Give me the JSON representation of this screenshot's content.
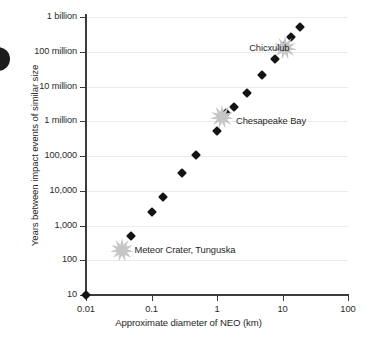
{
  "chart_data": {
    "type": "scatter",
    "title": "",
    "xlabel": "Approximate diameter of NEO (km)",
    "ylabel": "Years between impact events of similar size",
    "xscale": "log",
    "yscale": "log",
    "xlim": [
      0.01,
      100
    ],
    "ylim": [
      10,
      1000000000
    ],
    "grid": true,
    "legend": "none",
    "xticks": [
      {
        "value": 0.01,
        "label": "0.01"
      },
      {
        "value": 0.1,
        "label": "0.1"
      },
      {
        "value": 1,
        "label": "1"
      },
      {
        "value": 10,
        "label": "10"
      },
      {
        "value": 100,
        "label": "100"
      }
    ],
    "yticks": [
      {
        "value": 1000000000,
        "label": "1 billion"
      },
      {
        "value": 100000000,
        "label": "100 million"
      },
      {
        "value": 10000000,
        "label": "10 million"
      },
      {
        "value": 1000000,
        "label": "1 million"
      },
      {
        "value": 100000,
        "label": "100,000"
      },
      {
        "value": 10000,
        "label": "10,000"
      },
      {
        "value": 1000,
        "label": "1,000"
      },
      {
        "value": 100,
        "label": "100"
      },
      {
        "value": 10,
        "label": "10"
      }
    ],
    "series": [
      {
        "name": "Impact events",
        "marker": "diamond",
        "color": "#141414",
        "points": [
          {
            "x": 0.01,
            "y": 10
          },
          {
            "x": 0.048,
            "y": 500
          },
          {
            "x": 0.1,
            "y": 2500
          },
          {
            "x": 0.15,
            "y": 6500
          },
          {
            "x": 0.29,
            "y": 32000
          },
          {
            "x": 0.48,
            "y": 105000
          },
          {
            "x": 1.0,
            "y": 520000
          },
          {
            "x": 1.35,
            "y": 1700000
          },
          {
            "x": 1.85,
            "y": 2600000
          },
          {
            "x": 2.9,
            "y": 6500000
          },
          {
            "x": 4.8,
            "y": 21000000
          },
          {
            "x": 7.8,
            "y": 62000000
          },
          {
            "x": 10.5,
            "y": 150000000
          },
          {
            "x": 13.5,
            "y": 260000000
          },
          {
            "x": 18.5,
            "y": 520000000
          }
        ]
      }
    ],
    "annotations": [
      {
        "label": "Meteor Crater, Tunguska",
        "marker": "starburst",
        "marker_color": "#c6c6c6",
        "x": 0.035,
        "y": 200,
        "label_x": 0.055,
        "label_y": 200
      },
      {
        "label": "Chesapeake Bay",
        "marker": "starburst",
        "marker_color": "#c6c6c6",
        "x": 1.2,
        "y": 1300000,
        "label_x": 1.95,
        "label_y": 1000000
      },
      {
        "label": "Chicxulub",
        "marker": "starburst",
        "marker_color": "#c6c6c6",
        "x": 11.0,
        "y": 130000000,
        "label_x": 3.1,
        "label_y": 130000000
      }
    ],
    "colors": {
      "marker": "#141414",
      "burst": "#c6c6c6",
      "axis": "#3b3b3b",
      "grid": "#eceaea",
      "text": "#1f1f1f",
      "background": "#ffffff"
    }
  }
}
